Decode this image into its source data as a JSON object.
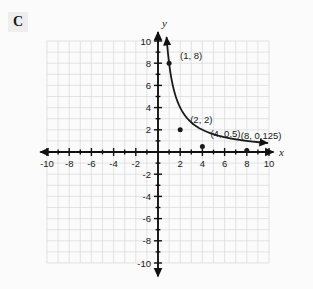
{
  "badge": {
    "label": "C"
  },
  "chart_data": {
    "type": "line",
    "title": "",
    "xlabel": "x",
    "ylabel": "y",
    "xlim": [
      -10,
      10
    ],
    "ylim": [
      -10,
      10
    ],
    "grid": true,
    "grid_step": 1,
    "tick_step": 2,
    "legend": "none",
    "xticks": [
      "-10",
      "-8",
      "-6",
      "-4",
      "-2",
      "2",
      "4",
      "6",
      "8",
      "10"
    ],
    "yticks": [
      "10",
      "8",
      "6",
      "4",
      "2",
      "-2",
      "-4",
      "-6",
      "-8",
      "-10"
    ],
    "xtick_values": [
      -10,
      -8,
      -6,
      -4,
      -2,
      2,
      4,
      6,
      8,
      10
    ],
    "ytick_values": [
      10,
      8,
      6,
      4,
      2,
      -2,
      -4,
      -6,
      -8,
      -10
    ],
    "series": [
      {
        "name": "y = 8/x",
        "style": "solid-curve-with-arrows",
        "color": "#1a1a1a",
        "x": [
          0.78,
          0.85,
          0.95,
          1.0,
          1.15,
          1.3,
          1.5,
          1.75,
          2.0,
          2.5,
          3.0,
          3.5,
          4.0,
          5.0,
          6.0,
          7.0,
          8.0,
          9.0,
          9.8
        ],
        "y": [
          10.3,
          9.4,
          8.4,
          8.0,
          6.96,
          6.15,
          5.33,
          4.57,
          2.0,
          1.28,
          1.07,
          0.91,
          0.5,
          0.32,
          0.22,
          0.16,
          0.125,
          0.09,
          0.05
        ]
      }
    ],
    "points": [
      {
        "x": 1,
        "y": 8,
        "label": "(1, 8)"
      },
      {
        "x": 2,
        "y": 2,
        "label": "(2, 2)"
      },
      {
        "x": 4,
        "y": 0.5,
        "label": "(4, 0.5)"
      },
      {
        "x": 8,
        "y": 0.125,
        "label": "(8, 0.125)"
      }
    ],
    "colors": {
      "curve": "#1a1a1a",
      "axis": "#111111",
      "grid": "#d9d9d9",
      "background": "#fbfbfb",
      "badge_bg": "#eeeeee"
    }
  }
}
